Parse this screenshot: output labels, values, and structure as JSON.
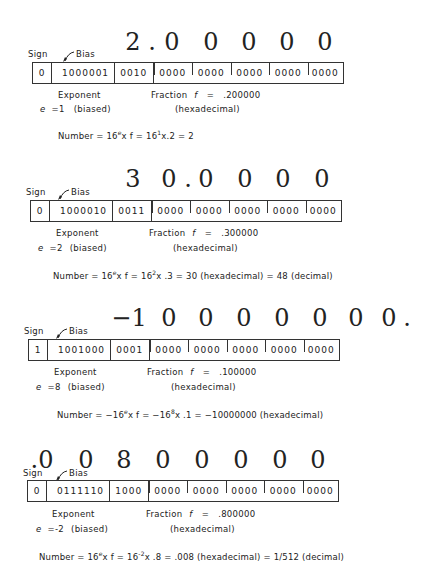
{
  "labels": {
    "sign": "Sign",
    "bias": "Bias",
    "exponent": "Exponent",
    "fraction_prefix": "Fraction",
    "fraction_symbol": "f",
    "equals": "=",
    "hexadecimal": "(hexadecimal)",
    "biased": "(biased)",
    "e_symbol": "e"
  },
  "examples": [
    {
      "display_digits": [
        "2",
        ".",
        "0",
        "0",
        "0",
        "0",
        "0"
      ],
      "sign_bit": "0",
      "exponent_bits": "1000001",
      "fraction_nibbles": [
        "0010",
        "0000",
        "0000",
        "0000",
        "0000",
        "0000"
      ],
      "e_value": "=1",
      "fraction_value": ".200000",
      "formula": {
        "prefix": "Number  =  16",
        "sup1": "e",
        "mid1": "x f   =   16",
        "sup2": "1",
        "mid2": "x.2 = 2",
        "sup3": "",
        "tail": ""
      }
    },
    {
      "display_digits": [
        "3",
        "0",
        ".",
        "0",
        "0",
        "0",
        "0"
      ],
      "sign_bit": "0",
      "exponent_bits": "1000010",
      "fraction_nibbles": [
        "0011",
        "0000",
        "0000",
        "0000",
        "0000",
        "0000"
      ],
      "e_value": "=2",
      "fraction_value": ".300000",
      "formula": {
        "prefix": "Number = 16",
        "sup1": "e",
        "mid1": "x f = 16",
        "sup2": "2",
        "mid2": "x .3 = 30 (hexadecimal) = 48 (decimal)",
        "sup3": "",
        "tail": ""
      }
    },
    {
      "display_digits": [
        "−1",
        "0",
        "0",
        "0",
        "0",
        "0",
        "0",
        "0",
        "."
      ],
      "sign_bit": "1",
      "exponent_bits": "1001000",
      "fraction_nibbles": [
        "0001",
        "0000",
        "0000",
        "0000",
        "0000",
        "0000"
      ],
      "e_value": "=8",
      "fraction_value": ".100000",
      "formula": {
        "prefix": "Number = −16",
        "sup1": "e",
        "mid1": "x f = −16",
        "sup2": "8",
        "mid2": "x .1 = −10000000 (hexadecimal)",
        "sup3": "",
        "tail": ""
      }
    },
    {
      "display_digits": [
        ".0",
        "0",
        "8",
        "0",
        "0",
        "0",
        "0",
        "0"
      ],
      "sign_bit": "0",
      "exponent_bits": "0111110",
      "fraction_nibbles": [
        "1000",
        "0000",
        "0000",
        "0000",
        "0000",
        "0000"
      ],
      "e_value": "=-2",
      "fraction_value": ".800000",
      "formula": {
        "prefix": "Number = 16",
        "sup1": "e",
        "mid1": "x f = 16",
        "sup2": "-2",
        "mid2": "x .8 = .008 (hexadecimal) = 1/512 (decimal)",
        "sup3": "",
        "tail": ""
      }
    }
  ]
}
